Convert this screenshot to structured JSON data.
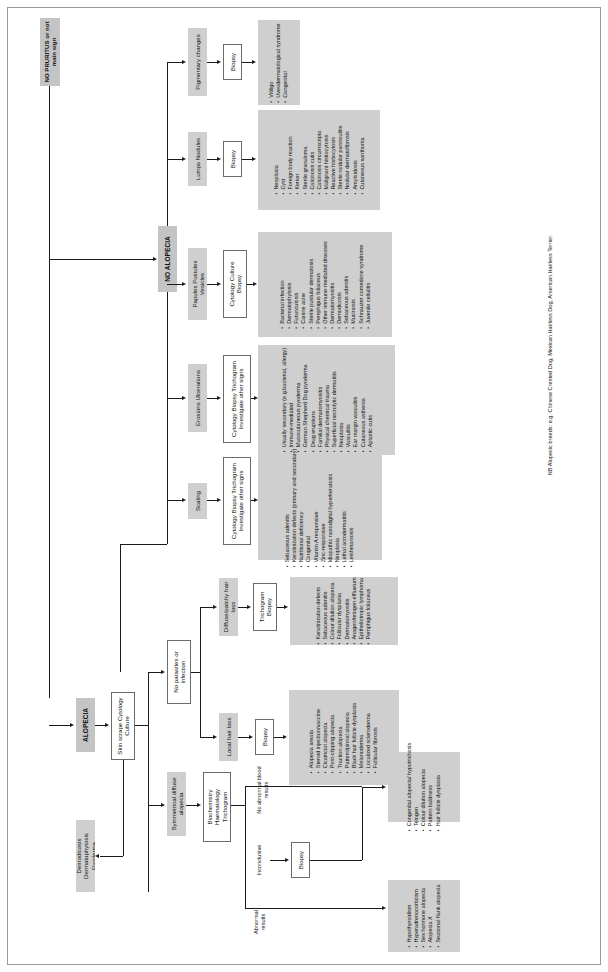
{
  "title_header": "NO PRURITUS\nor not main sign",
  "root": {
    "label": "NO PRURITUS or not main sign"
  },
  "branches": {
    "no_alopecia": "NO ALOPECIA",
    "alopecia": "ALOPECIA"
  },
  "signs": {
    "pigmentary": "Pigmentary changes",
    "lumps": "Lumps Nodules",
    "papules": "Papules Pustules Vesicles",
    "erosions": "Erosions Ulcerations",
    "scaling": "Scaling"
  },
  "tests": {
    "biopsy_pigmentary": "Biopsy",
    "biopsy_lumps": "Biopsy",
    "cyt_cult_biopsy": "Cytology Culture Biopsy",
    "cyt_biopsy_tricho_other_1": "Cytology Biopsy Trichogram Investigate other signs",
    "cyt_biopsy_tricho_other_2": "Cytology Biopsy Trichogram Investigate other signs",
    "skin_scrape": "Skin scrape Cytology Culture",
    "biochemistry": "Biochemistry Haematology Trichogram",
    "biopsy_local": "Biopsy",
    "tricho_biopsy": "Trichogram Biopsy",
    "biopsy_sym": "Biopsy"
  },
  "alopecia_nodes": {
    "demodicosis": "Demodicosis Dermatophytosis Pyoderma",
    "symmetrical": "Symmetrical diffuse alopecia",
    "no_parasites": "No parasites or infection",
    "local_hair_loss": "Local hair loss",
    "diffuse_patchy": "Diffuse/patchy hair loss"
  },
  "edge_labels": {
    "abnormal": "Abnormal results",
    "inconclusive": "Inconclusive",
    "no_abnormal": "No abnormal blood results"
  },
  "lists": {
    "pigmentary": [
      "Vitiligo",
      "Uveodermatological syndrome",
      "Congenital"
    ],
    "lumps": [
      "Neoplasia",
      "Cyst",
      "Foreign body reaction",
      "Kerion",
      "Sterile granuloma",
      "Calcinosis cutis",
      "Calcinosis circumscripta",
      "Malignant histiocytosis",
      "Reactive histiocytosis",
      "Sterile nodular panniculitis",
      "Nodular dermatofibrosis",
      "Amyloidosis",
      "Cutaneous xanthoma"
    ],
    "papules": [
      "Bacterial infection",
      "Dermatophytosis",
      "Furunculosis",
      "Canine acne",
      "Sterile pustular dermatosis",
      "Pemphigus foliaceus",
      "Other immune-mediated diseases",
      "Dermatomyositis",
      "Demodicosis",
      "Sebaceous adenitis",
      "Mucinosis",
      "Schnauzer comedone syndrome",
      "Juvenile cellulitis"
    ],
    "erosions": [
      "Usually secondary (e.g.bacterial, allergy)",
      "Immune-mediated",
      "Mucocutaneous pyoderma",
      "German Shepherd Dog pyoderma",
      "Drug eruptions",
      "Familial dermatomyositis",
      "Physical chemical trauma",
      "Superficial necrolytic dermatitis",
      "Neoplasia",
      "Vasculitis",
      "Ear margin vasculitis",
      "Cutaneous asthenia",
      "Aplastic cutis"
    ],
    "scaling": [
      "Sebaceous adenitis",
      "Keratinization defects (primary and secondary)",
      "Nutritional deficiency",
      "Congenital",
      "Vitamin A responsive",
      "Zinc-responsive",
      "Idiopathic nasodigital hyperkeratosis",
      "Neoplasia",
      "Lethal acrodermatitis",
      "Leishmaniosis"
    ],
    "diffuse_patchy": [
      "Keratinization defects",
      "Sebaceous adenitis",
      "Colour dilution alopecia",
      "Follicular dysplasia",
      "Dermatomyositis",
      "Anagen/telogen effluvium",
      "Epitheliotropic lymphoma",
      "Pemphigus foliaceus"
    ],
    "local_hair_loss": [
      "Alopecia areata",
      "Steroid injection/vaccine",
      "Cicatricial alopecia",
      "Post-clipping alopecia",
      "Traction alopecia",
      "Pattern/pinnal alopecia",
      "Black hair follicle dysplasia",
      "Melanoderma",
      "Localized scleroderma",
      "Follicular fibrosis"
    ],
    "congenital": [
      "Congenital alopecia/ hypotrichosis",
      "Telogen",
      "Colour dilution alopecia",
      "Pattern baldness",
      "Hair follicle dysplasia"
    ],
    "endocrine": [
      "Hypothyroidism",
      "Hyperadrenocorticism",
      "Sex hormone alopecia",
      "Alopecia X",
      "Seasonal flank alopecia"
    ]
  },
  "footnote": "NB Alopecic breeds: e.g. Chinese Crested Dog, Mexican Hairless Dog, American Hairless Terrier."
}
